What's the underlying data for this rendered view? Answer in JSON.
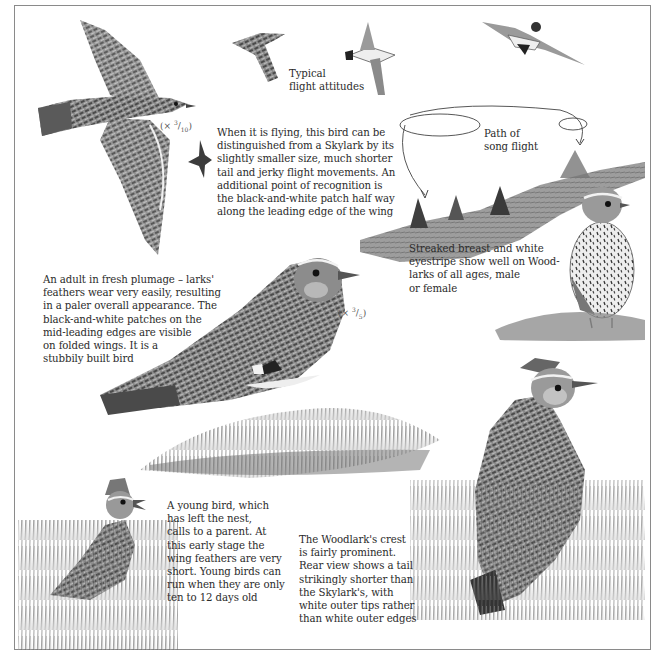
{
  "page": {
    "palette": {
      "paper": "#ffffff",
      "frame": "#8a8a8a",
      "ink": "#2b2b2b",
      "plumage_dark": "#3a3a3a",
      "plumage_mid": "#7a7a7a",
      "plumage_light": "#c8c8c8",
      "breast": "#eeeeee",
      "grass": "#6f6f6f"
    }
  },
  "labels": {
    "flight_attitudes": "Typical\nflight attitudes",
    "song_flight": "Path of\nsong flight",
    "scale_flying": {
      "prefix": "(× ",
      "num": "3",
      "den": "10",
      "suffix": ")"
    },
    "scale_adult": {
      "prefix": "(× ",
      "num": "3",
      "den": "5",
      "suffix": ")"
    }
  },
  "captions": {
    "flying": "When it is flying, this bird can be\ndistinguished from a Skylark by its\nslightly smaller size, much shorter\ntail and jerky flight movements. An\nadditional point of recognition is\nthe black-and-white patch half way\nalong the leading edge of the wing",
    "adult": "An adult in fresh plumage – larks'\nfeathers wear very easily, resulting\nin a paler overall appearance. The\nblack-and-white patches on the\nmid-leading edges are visible\non folded wings. It is a\nstubbily built bird",
    "breast": "Streaked breast and white\neyestripe show well on Wood-\nlarks of all ages, male\nor female",
    "young": "A young bird, which\nhas left the nest,\ncalls to a parent. At\nthis early stage the\nwing feathers are very\nshort. Young birds can\nrun when they are only\nten to 12 days old",
    "crest": "The Woodlark's crest\nis fairly prominent.\nRear view shows a tail\nstrikingly shorter than\nthe Skylark's, with\nwhite outer tips rather\nthan white outer edges"
  },
  "illustrations": [
    {
      "id": "flying-large",
      "desc": "Woodlark in flight, spread wings, top view"
    },
    {
      "id": "flying-small-silhouette",
      "desc": "small flying silhouette"
    },
    {
      "id": "flight-attitude-1",
      "desc": "side view in flight"
    },
    {
      "id": "flight-attitude-2",
      "desc": "underside view in flight"
    },
    {
      "id": "flight-attitude-3",
      "desc": "gliding underside view"
    },
    {
      "id": "song-flight-path",
      "desc": "looping flight path with arrows over hillside with conifers"
    },
    {
      "id": "adult-perched",
      "desc": "adult Woodlark on grass tuft, side view"
    },
    {
      "id": "front-view",
      "desc": "Woodlark front view showing streaked breast"
    },
    {
      "id": "young-bird",
      "desc": "young Woodlark calling in tall grass"
    },
    {
      "id": "rear-view",
      "desc": "Woodlark rear view with raised crest in grass"
    }
  ]
}
